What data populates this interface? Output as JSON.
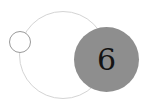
{
  "graphic": {
    "number": "6",
    "colors": {
      "badge_fill": "#8e8e8e",
      "number_text": "#141414",
      "large_ring_stroke": "#d4d4d4",
      "small_ring_stroke": "#9a9a9a",
      "background": "#ffffff"
    }
  }
}
